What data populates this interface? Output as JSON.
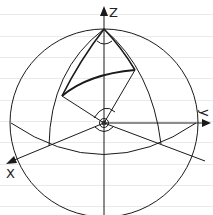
{
  "diagram": {
    "axes": {
      "z_label": "Z",
      "y_label": "y",
      "x_label": "X"
    },
    "colors": {
      "stroke": "#1a1a1a",
      "background": "#ffffff",
      "ruled_lines": "#eaeaea"
    },
    "elements": [
      "sphere-outline",
      "equator-ellipse",
      "meridian-left",
      "meridian-right",
      "great-circle-arc",
      "radius-lines",
      "angle-arc-north-pole",
      "angle-arcs-center",
      "origin-marker"
    ]
  }
}
